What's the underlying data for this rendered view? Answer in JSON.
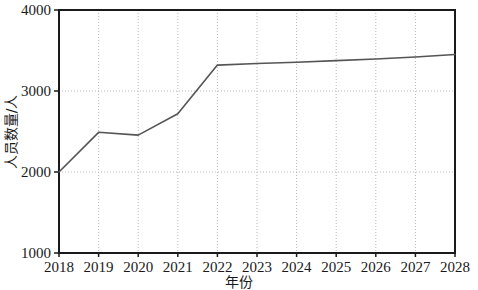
{
  "chart_data": {
    "type": "line",
    "title": "",
    "xlabel": "年份",
    "ylabel": "人员数量/人",
    "categories": [
      "2018",
      "2019",
      "2020",
      "2021",
      "2022",
      "2023",
      "2024",
      "2025",
      "2026",
      "2027",
      "2028"
    ],
    "x": [
      2018,
      2019,
      2020,
      2021,
      2022,
      2023,
      2024,
      2025,
      2026,
      2027,
      2028
    ],
    "values": [
      2000,
      2490,
      2455,
      2720,
      3320,
      3340,
      3355,
      3375,
      3395,
      3420,
      3450
    ],
    "series": [
      {
        "name": "人员数量",
        "values": [
          2000,
          2490,
          2455,
          2720,
          3320,
          3340,
          3355,
          3375,
          3395,
          3420,
          3450
        ]
      }
    ],
    "xlim": [
      2018,
      2028
    ],
    "ylim": [
      1000,
      4000
    ],
    "yticks": [
      1000,
      2000,
      3000,
      4000
    ],
    "yticklabels": [
      "1000",
      "2000",
      "3000",
      "4000"
    ],
    "xticks": [
      2018,
      2019,
      2020,
      2021,
      2022,
      2023,
      2024,
      2025,
      2026,
      2027,
      2028
    ],
    "xticklabels": [
      "2018",
      "2019",
      "2020",
      "2021",
      "2022",
      "2023",
      "2024",
      "2025",
      "2026",
      "2027",
      "2028"
    ],
    "grid": true,
    "grid_style": "dotted",
    "legend": false,
    "legend_position": "none",
    "line_color": "#555555",
    "grid_color": "#b9b9b9",
    "axis_color": "#1a1a1a",
    "background_color": "#ffffff"
  }
}
